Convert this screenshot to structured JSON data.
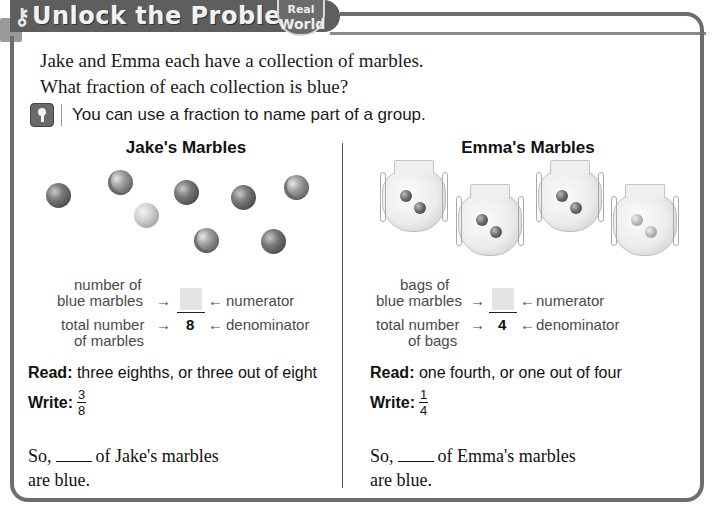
{
  "header": {
    "title": "Unlock the Problem",
    "badge_line1": "Real",
    "badge_line2": "World"
  },
  "intro": {
    "line1": "Jake and Emma each have a collection of marbles.",
    "line2": "What fraction of each collection is blue?"
  },
  "hint": {
    "text": "You can use a fraction to name part of a group."
  },
  "jake": {
    "title": "Jake's Marbles",
    "marbles": [
      {
        "type": "solid",
        "x": 20,
        "y": 45
      },
      {
        "type": "swirl",
        "x": 82,
        "y": 32
      },
      {
        "type": "light",
        "x": 108,
        "y": 65
      },
      {
        "type": "solid",
        "x": 148,
        "y": 42
      },
      {
        "type": "solid",
        "x": 205,
        "y": 47
      },
      {
        "type": "swirl",
        "x": 258,
        "y": 37
      },
      {
        "type": "swirl",
        "x": 168,
        "y": 90
      },
      {
        "type": "solid",
        "x": 235,
        "y": 91
      }
    ],
    "numerator_label_1": "number of",
    "numerator_label_2": "blue marbles",
    "denominator_label_1": "total number",
    "denominator_label_2": "of marbles",
    "arrow_right": "→",
    "arrow_left": "←",
    "numerator_term": "numerator",
    "denominator_term": "denominator",
    "denominator_value": "8",
    "read_label": "Read:",
    "read_text": " three eighths, or three out of eight",
    "write_label": "Write:",
    "write_num": "3",
    "write_den": "8",
    "so_prefix": "So,",
    "so_suffix": "of Jake's marbles",
    "so_line2": "are blue."
  },
  "emma": {
    "title": "Emma's Marbles",
    "bags": [
      {
        "x": 14,
        "y": 22,
        "light": false
      },
      {
        "x": 90,
        "y": 46,
        "light": false
      },
      {
        "x": 170,
        "y": 22,
        "light": false
      },
      {
        "x": 245,
        "y": 46,
        "light": true
      }
    ],
    "numerator_label_1": "bags of",
    "numerator_label_2": "blue marbles",
    "denominator_label_1": "total number",
    "denominator_label_2": "of bags",
    "arrow_right": "→",
    "arrow_left": "←",
    "numerator_term": "numerator",
    "denominator_term": "denominator",
    "denominator_value": "4",
    "read_label": "Read:",
    "read_text": " one fourth, or one out of four",
    "write_label": "Write:",
    "write_num": "1",
    "write_den": "4",
    "so_prefix": "So,",
    "so_suffix": "of Emma's marbles",
    "so_line2": "are blue."
  }
}
